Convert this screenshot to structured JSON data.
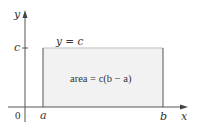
{
  "diagram": {
    "type": "rectangle-area-under-constant-function",
    "axes": {
      "x_label": "x",
      "y_label": "y",
      "origin_label": "0"
    },
    "ticks": {
      "x": [
        "a",
        "b"
      ],
      "y": [
        "c"
      ]
    },
    "function_label": "y = c",
    "region_label": "area = c(b − a)",
    "colors": {
      "axis": "#555555",
      "rectangle_fill": "#f2f2f2",
      "rectangle_edge": "#555555",
      "text": "#333333"
    }
  }
}
